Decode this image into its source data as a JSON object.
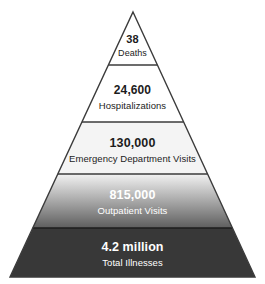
{
  "figure": {
    "name": "illness-severity-pyramid",
    "type": "pyramid-diagram",
    "background_color": "#ffffff",
    "outline_color": "#3b3b3b",
    "apex": {
      "x": 133,
      "y": 12
    },
    "base": {
      "left_x": 10,
      "right_x": 255,
      "y": 277
    }
  },
  "tiers": [
    {
      "id": "deaths",
      "value": "38",
      "label": "Deaths",
      "top_y": 12,
      "bottom_y": 65,
      "fill_type": "solid",
      "fill_color": "#ffffff",
      "text_color": "#1c1c1c",
      "value_font_size": 11,
      "label_font_size": 9,
      "value_y": 34,
      "label_y": 48
    },
    {
      "id": "hospitalizations",
      "value": "24,600",
      "label": "Hospitalizations",
      "top_y": 65,
      "bottom_y": 122,
      "fill_type": "solid",
      "fill_color": "#ffffff",
      "text_color": "#1c1c1c",
      "value_font_size": 12,
      "label_font_size": 9.5,
      "value_y": 84,
      "label_y": 100
    },
    {
      "id": "emergency-department-visits",
      "value": "130,000",
      "label": "Emergency Department Visits",
      "top_y": 122,
      "bottom_y": 174,
      "fill_type": "solid",
      "fill_color": "#f4f4f4",
      "text_color": "#1c1c1c",
      "value_font_size": 12.5,
      "label_font_size": 9.5,
      "value_y": 137,
      "label_y": 153
    },
    {
      "id": "outpatient-visits",
      "value": "815,000",
      "label": "Outpatient Visits",
      "top_y": 174,
      "bottom_y": 228,
      "fill_type": "gradient",
      "fill_color_top": "#f2f2f2",
      "fill_color_bottom": "#5e5e5e",
      "text_color": "#ffffff",
      "value_font_size": 12.5,
      "label_font_size": 9.5,
      "value_y": 189,
      "label_y": 205
    },
    {
      "id": "total-illnesses",
      "value": "4.2 million",
      "label": "Total Illnesses",
      "top_y": 228,
      "bottom_y": 277,
      "fill_type": "solid",
      "fill_color": "#383838",
      "text_color": "#ffffff",
      "value_font_size": 12.5,
      "label_font_size": 9.5,
      "value_y": 241,
      "label_y": 257
    }
  ],
  "chart_data": {
    "type": "pyramid",
    "title": "",
    "xlabel": "",
    "ylabel": "",
    "categories": [
      "Deaths",
      "Hospitalizations",
      "Emergency Department Visits",
      "Outpatient Visits",
      "Total Illnesses"
    ],
    "value_labels": [
      "38",
      "24,600",
      "130,000",
      "815,000",
      "4.2 million"
    ],
    "values": [
      38,
      24600,
      130000,
      815000,
      4200000
    ],
    "order": "apex-to-base",
    "legend": "none",
    "grid": false
  }
}
